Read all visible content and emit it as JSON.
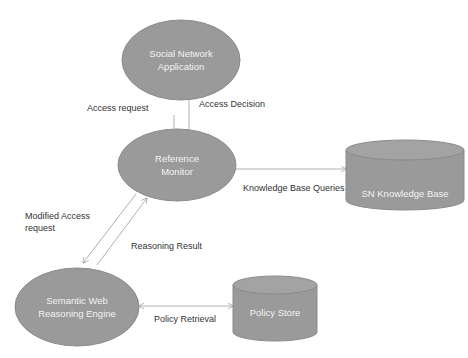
{
  "diagram": {
    "colors": {
      "node_fill": "#9a9a9a",
      "node_stroke": "#7f7f7f",
      "edge": "#b0b0b0",
      "label_text": "#333333",
      "node_text": "#f2f2f2"
    },
    "nodes": {
      "social_network": {
        "label_line1": "Social Network",
        "label_line2": "Application",
        "shape": "ellipse"
      },
      "reference_monitor": {
        "label_line1": "Reference",
        "label_line2": "Monitor",
        "shape": "ellipse"
      },
      "sn_kb": {
        "label": "SN Knowledge Base",
        "shape": "cylinder"
      },
      "reasoning_engine": {
        "label_line1": "Semantic Web",
        "label_line2": "Reasoning Engine",
        "shape": "ellipse"
      },
      "policy_store": {
        "label": "Policy Store",
        "shape": "cylinder"
      }
    },
    "edges": {
      "access_request": "Access request",
      "access_decision": "Access Decision",
      "kb_queries": "Knowledge Base Queries",
      "modified_access_line1": "Modified Access",
      "modified_access_line2": "request",
      "reasoning_result": "Reasoning Result",
      "policy_retrieval": "Policy Retrieval"
    }
  }
}
